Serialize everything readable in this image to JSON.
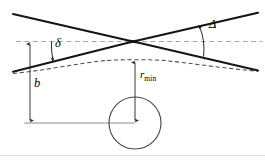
{
  "figure": {
    "type": "scientific-diagram",
    "width": 265,
    "height": 161,
    "background_color": "#ffffff",
    "labels": {
      "deflection_small": "δ",
      "deflection_total": "Δ",
      "impact_parameter": "b",
      "closest_approach_symbol": "r",
      "closest_approach_subscript": "min"
    },
    "colors": {
      "asymptote_line": "#1a1a1a",
      "trajectory_dashed": "#555555",
      "reference_dashed": "#9a9a9a",
      "circle_stroke": "#4a4a4a",
      "dimension_arrow": "#3a3a3a",
      "baseline": "#8a8a8a",
      "footer_rule": "#d8d8d8"
    },
    "geometry": {
      "crossing_point": [
        133,
        41.5
      ],
      "upper_left_asymptote": [
        [
          13,
          14
        ],
        [
          133,
          41.5
        ]
      ],
      "upper_right_asymptote": [
        [
          133,
          41.5
        ],
        [
          258,
          13
        ]
      ],
      "lower_left_asymptote": [
        [
          13,
          72
        ],
        [
          133,
          41.5
        ]
      ],
      "lower_right_asymptote": [
        [
          133,
          41.5
        ],
        [
          258,
          70
        ]
      ],
      "horizontal_reference_dashed_y": 41.5,
      "trajectory_apex": [
        135,
        60
      ],
      "trajectory_ends": [
        [
          13,
          73
        ],
        [
          258,
          71
        ]
      ],
      "circle_center": [
        135,
        123
      ],
      "circle_radius": 26,
      "baseline_y": 123,
      "baseline_span": [
        26,
        135
      ],
      "b_arrow_x": 30,
      "b_arrow_span_y": [
        41.5,
        123
      ],
      "rmin_arrow_x": 135,
      "rmin_arrow_span_y": [
        60,
        123
      ],
      "delta_arc_center": [
        133,
        41.5
      ],
      "delta_label_pos": [
        55,
        44
      ],
      "big_delta_label_pos": [
        208,
        25
      ],
      "b_label_pos": [
        33,
        84
      ],
      "rmin_label_pos": [
        139,
        74
      ],
      "footer_rule_y": 155
    }
  }
}
